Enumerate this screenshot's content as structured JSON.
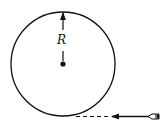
{
  "diagram": {
    "radius_label": "R",
    "elements": [
      "circle",
      "center-point",
      "radius-arrow",
      "dashed-tangent-path",
      "velocity-arrow",
      "projectile"
    ],
    "colors": {
      "stroke": "#111111",
      "background": "#ffffff"
    }
  }
}
